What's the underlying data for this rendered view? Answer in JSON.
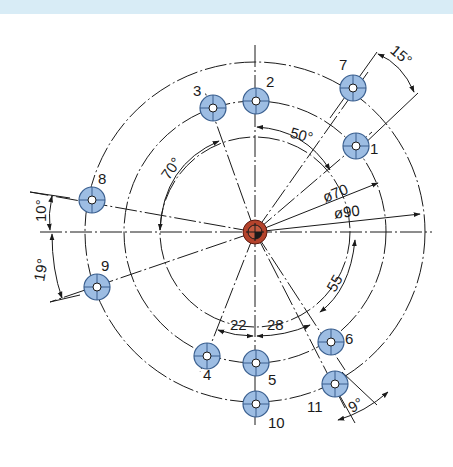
{
  "drawing": {
    "title": "Bolt circle hole pattern",
    "center": {
      "x": 255,
      "y": 232
    },
    "colors": {
      "line": "#1a1a1a",
      "hole_fill": "#9dbde3",
      "hole_stroke": "#3a5f8f",
      "center_fill": "#b4432c",
      "band": "#d8ecf6"
    },
    "circles": [
      {
        "name": "inner-circle",
        "r": 95
      },
      {
        "name": "pitch-circle-70",
        "r": 131
      },
      {
        "name": "pitch-circle-90",
        "r": 170
      }
    ],
    "diameter_labels": {
      "d70": "ø70",
      "d90": "ø90"
    },
    "holes": [
      {
        "id": "1",
        "label": "1",
        "x": 356,
        "y": 146
      },
      {
        "id": "2",
        "label": "2",
        "x": 256,
        "y": 101
      },
      {
        "id": "3",
        "label": "3",
        "x": 213,
        "y": 108
      },
      {
        "id": "4",
        "label": "4",
        "x": 207,
        "y": 356
      },
      {
        "id": "5",
        "label": "5",
        "x": 256,
        "y": 363
      },
      {
        "id": "6",
        "label": "6",
        "x": 331,
        "y": 342
      },
      {
        "id": "7",
        "label": "7",
        "x": 353,
        "y": 88
      },
      {
        "id": "8",
        "label": "8",
        "x": 92,
        "y": 200
      },
      {
        "id": "9",
        "label": "9",
        "x": 97,
        "y": 287
      },
      {
        "id": "10",
        "label": "10",
        "x": 256,
        "y": 404
      },
      {
        "id": "11",
        "label": "11",
        "x": 335,
        "y": 384
      }
    ],
    "dimensions": {
      "angle_15": "15°",
      "angle_50": "50°",
      "angle_70": "70°",
      "angle_10": "10°",
      "angle_19": "19°",
      "angle_9": "9°",
      "arc_55": "55",
      "arc_22": "22",
      "arc_28": "28"
    }
  }
}
